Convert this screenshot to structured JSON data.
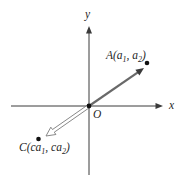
{
  "figure": {
    "background_color": "#ffffff",
    "axis_color": "#3a3a3a",
    "vector_color": "#696969",
    "arrowhead_color": "#3a3a3a",
    "hollow_vector_outline_color": "#7a7a7a",
    "point_color": "#111111",
    "labels": {
      "y_axis": "y",
      "x_axis": "x",
      "origin": "O",
      "point_a": {
        "pre": "A(a",
        "sub1": "1",
        "mid": ", a",
        "sub2": "2",
        "post": ")"
      },
      "point_c": {
        "pre": "C(ca",
        "sub1": "1",
        "mid": ", ca",
        "sub2": "2",
        "post": ")"
      }
    }
  }
}
